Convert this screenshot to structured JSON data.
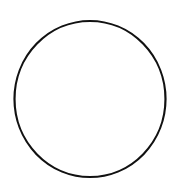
{
  "canvas": {
    "width": 173,
    "height": 182,
    "background": "#ffffff"
  },
  "shapes": [
    {
      "type": "circle",
      "cx": 90,
      "cy": 99,
      "rx": 75.5,
      "ry": 78,
      "stroke": "#111111",
      "stroke_width": 2.2,
      "fill": "none"
    }
  ]
}
